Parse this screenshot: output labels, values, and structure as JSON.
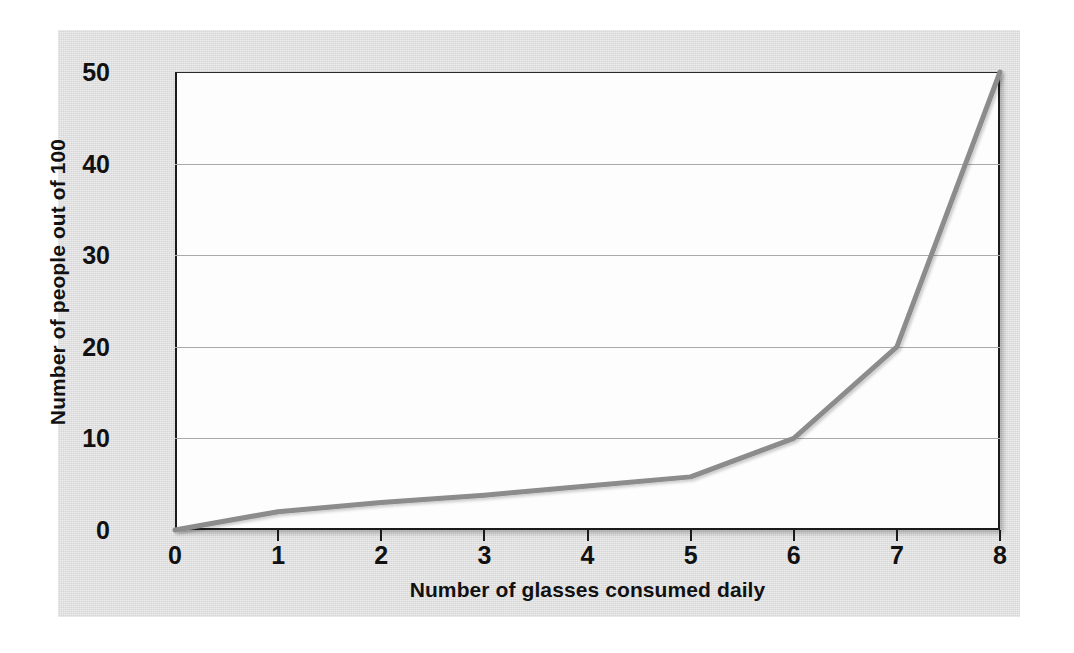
{
  "chart_data": {
    "type": "line",
    "title": "",
    "xlabel": "Number of glasses consumed daily",
    "ylabel": "Number of people out of 100",
    "x": [
      0,
      1,
      2,
      3,
      4,
      5,
      6,
      7,
      8
    ],
    "values": [
      0,
      2,
      3,
      3.8,
      4.8,
      5.8,
      10,
      20,
      50
    ],
    "xlim": [
      0,
      8
    ],
    "ylim": [
      0,
      50
    ],
    "xticks": [
      "0",
      "1",
      "2",
      "3",
      "4",
      "5",
      "6",
      "7",
      "8"
    ],
    "yticks": [
      "0",
      "10",
      "20",
      "30",
      "40",
      "50"
    ],
    "ytick_values": [
      0,
      10,
      20,
      30,
      40,
      50
    ],
    "gridlines_y": [
      10,
      20,
      30,
      40
    ],
    "grid": "horizontal",
    "legend": "none",
    "series": [
      {
        "name": "People out of 100",
        "values": [
          0,
          2,
          3,
          3.8,
          4.8,
          5.8,
          10,
          20,
          50
        ]
      }
    ]
  },
  "style": {
    "panel_background": "#dcdcdc",
    "plot_background": "#fdfdfd",
    "line_color": "#8c8c8c",
    "axis_color": "#1b1b1b",
    "gridline_color": "#a9a9a9",
    "text_color": "#111111",
    "page_background": "#ffffff"
  }
}
